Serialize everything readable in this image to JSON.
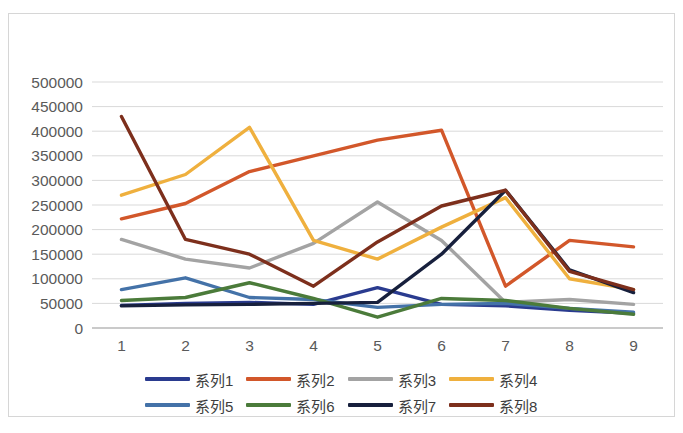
{
  "chart_data": {
    "type": "line",
    "title": "",
    "subtitle": "",
    "xlabel": "",
    "ylabel": "",
    "categories": [
      "1",
      "2",
      "3",
      "4",
      "5",
      "6",
      "7",
      "8",
      "9"
    ],
    "x_tick_labels": [
      "1",
      "2",
      "3",
      "4",
      "5",
      "6",
      "7",
      "8",
      "9"
    ],
    "y_tick_labels": [
      "500000",
      "450000",
      "400000",
      "350000",
      "300000",
      "250000",
      "200000",
      "150000",
      "100000",
      "50000",
      "0"
    ],
    "ylim": [
      0,
      500000
    ],
    "y_major_step": 50000,
    "grid": {
      "horizontal": true,
      "vertical": false,
      "color": "#d9d9d9"
    },
    "legend": {
      "position": "bottom",
      "columns": 4,
      "rows": 2
    },
    "series": [
      {
        "name": "系列1",
        "color": "#2a3b8f",
        "values": [
          46000,
          50000,
          52000,
          48000,
          82000,
          48000,
          45000,
          36000,
          30000
        ]
      },
      {
        "name": "系列2",
        "color": "#d2572a",
        "values": [
          222000,
          253000,
          318000,
          350000,
          382000,
          402000,
          85000,
          178000,
          165000
        ]
      },
      {
        "name": "系列3",
        "color": "#a3a3a3",
        "values": [
          180000,
          140000,
          122000,
          172000,
          256000,
          178000,
          52000,
          58000,
          48000
        ]
      },
      {
        "name": "系列4",
        "color": "#efb03e",
        "values": [
          270000,
          312000,
          408000,
          178000,
          140000,
          205000,
          265000,
          100000,
          78000
        ]
      },
      {
        "name": "系列5",
        "color": "#4472a8",
        "values": [
          78000,
          102000,
          62000,
          58000,
          42000,
          48000,
          50000,
          40000,
          32000
        ]
      },
      {
        "name": "系列6",
        "color": "#4b7b3a",
        "values": [
          56000,
          62000,
          92000,
          60000,
          22000,
          60000,
          56000,
          40000,
          28000
        ]
      },
      {
        "name": "系列7",
        "color": "#17203d",
        "values": [
          45000,
          47000,
          48000,
          50000,
          52000,
          150000,
          280000,
          118000,
          72000
        ]
      },
      {
        "name": "系列8",
        "color": "#7d2f1c",
        "values": [
          430000,
          180000,
          150000,
          85000,
          175000,
          248000,
          280000,
          115000,
          78000
        ]
      }
    ]
  },
  "legend_entries": [
    {
      "label": "系列1",
      "color": "#2a3b8f"
    },
    {
      "label": "系列2",
      "color": "#d2572a"
    },
    {
      "label": "系列3",
      "color": "#a3a3a3"
    },
    {
      "label": "系列4",
      "color": "#efb03e"
    },
    {
      "label": "系列5",
      "color": "#4472a8"
    },
    {
      "label": "系列6",
      "color": "#4b7b3a"
    },
    {
      "label": "系列7",
      "color": "#17203d"
    },
    {
      "label": "系列8",
      "color": "#7d2f1c"
    }
  ],
  "colors": {
    "background": "#ffffff",
    "frame_border": "#d6d6d6",
    "gridline": "#d9d9d9",
    "axis_line": "#bfbfbf",
    "tick_text": "#5a5a5a",
    "legend_text": "#3d3d3d"
  }
}
